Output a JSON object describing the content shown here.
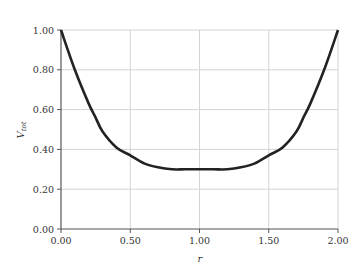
{
  "chart_data": {
    "type": "line",
    "title": "",
    "xlabel": "r",
    "ylabel": "V_tot",
    "ylabel_main": "V",
    "ylabel_sub": "tot",
    "xlim": [
      0,
      2
    ],
    "ylim": [
      0,
      1
    ],
    "grid": true,
    "legend": null,
    "x_ticks": [
      "0.00",
      "0.50",
      "1.00",
      "1.50",
      "2.00"
    ],
    "y_ticks": [
      "0.00",
      "0.20",
      "0.40",
      "0.60",
      "0.80",
      "1.00"
    ],
    "series": [
      {
        "name": "V_tot",
        "color": "#222222",
        "x": [
          0.0,
          0.1,
          0.2,
          0.25,
          0.3,
          0.4,
          0.5,
          0.6,
          0.7,
          0.8,
          0.9,
          1.0,
          1.1,
          1.2,
          1.3,
          1.4,
          1.5,
          1.6,
          1.7,
          1.75,
          1.8,
          1.9,
          2.0
        ],
        "values": [
          1.0,
          0.8,
          0.63,
          0.56,
          0.49,
          0.41,
          0.37,
          0.33,
          0.31,
          0.3,
          0.3,
          0.3,
          0.3,
          0.3,
          0.31,
          0.33,
          0.37,
          0.41,
          0.49,
          0.56,
          0.63,
          0.8,
          1.0
        ]
      }
    ]
  }
}
